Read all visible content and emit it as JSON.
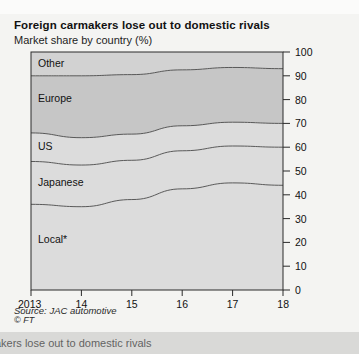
{
  "header": {
    "title": "Foreign carmakers lose out to domestic rivals",
    "subtitle": "Market share by country (%)"
  },
  "footer": {
    "source": "Source: JAC automotive",
    "copyright": "© FT",
    "bottom_caption": "armakers lose out to domestic rivals"
  },
  "colors": {
    "background": "#f4f4f2",
    "band_light": "#dcdcdc",
    "band_mid": "#d2d2d2",
    "band_dark": "#c6c6c6",
    "line": "#4a4a4a",
    "axis": "#2b2b2b",
    "bottom_strip": "#d9d9d7"
  },
  "chart_data": {
    "type": "area",
    "title": "Foreign carmakers lose out to domestic rivals",
    "subtitle": "Market share by country (%)",
    "xlabel": "",
    "ylabel": "",
    "stacked": true,
    "stack_order_bottom_to_top": [
      "Local*",
      "Japanese",
      "US",
      "Europe",
      "Other"
    ],
    "grid": false,
    "legend": "inline-band-labels",
    "ylim": [
      0,
      100
    ],
    "yticks": [
      0,
      10,
      20,
      30,
      40,
      50,
      60,
      70,
      80,
      90,
      100
    ],
    "ytick_labels": [
      "0",
      "10",
      "20",
      "30",
      "40",
      "50",
      "60",
      "70",
      "80",
      "90",
      "100"
    ],
    "y_axis_position": "right",
    "x": [
      2013,
      2014,
      2015,
      2016,
      2017,
      2018
    ],
    "xtick_labels": [
      "2013",
      "14",
      "15",
      "16",
      "17",
      "18"
    ],
    "xlim": [
      2013,
      2018
    ],
    "series": [
      {
        "name": "Local*",
        "values": [
          36.0,
          35.0,
          38.0,
          42.5,
          45.0,
          44.0
        ]
      },
      {
        "name": "Japanese",
        "values": [
          18.0,
          17.5,
          16.5,
          16.0,
          15.5,
          16.0
        ]
      },
      {
        "name": "US",
        "values": [
          12.0,
          11.5,
          11.0,
          10.5,
          10.0,
          10.0
        ]
      },
      {
        "name": "Europe",
        "values": [
          24.0,
          26.0,
          25.0,
          23.5,
          23.0,
          23.0
        ]
      },
      {
        "name": "Other",
        "values": [
          10.0,
          10.0,
          9.5,
          7.5,
          6.5,
          7.0
        ]
      }
    ],
    "cumulative_tops": {
      "Local*": [
        36.0,
        35.0,
        38.0,
        42.5,
        45.0,
        44.0
      ],
      "Japanese": [
        54.0,
        52.5,
        54.5,
        58.5,
        60.5,
        60.0
      ],
      "US": [
        66.0,
        64.0,
        65.5,
        69.0,
        70.5,
        70.0
      ],
      "Europe": [
        90.0,
        90.0,
        90.5,
        92.5,
        93.5,
        93.0
      ],
      "Other": [
        100.0,
        100.0,
        100.0,
        100.0,
        100.0,
        100.0
      ]
    },
    "band_labels": [
      {
        "text": "Other",
        "x_px": 38,
        "y_px": 67
      },
      {
        "text": "Europe",
        "x_px": 38,
        "y_px": 102
      },
      {
        "text": "US",
        "x_px": 38,
        "y_px": 150
      },
      {
        "text": "Japanese",
        "x_px": 38,
        "y_px": 186
      },
      {
        "text": "Local*",
        "x_px": 38,
        "y_px": 243
      }
    ]
  }
}
